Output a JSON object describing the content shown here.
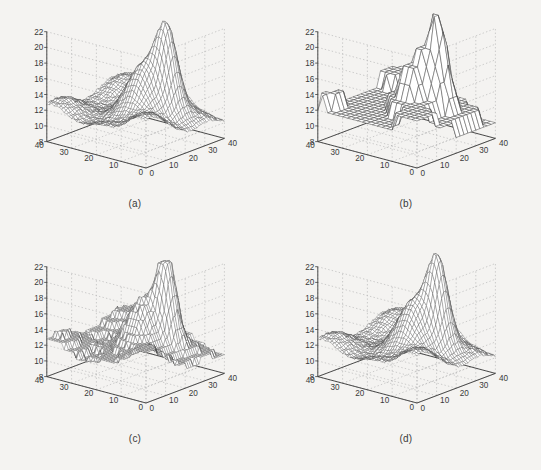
{
  "figure": {
    "background_color": "#f4f3f1",
    "ink_color": "#3a3a3a",
    "grid_color": "#b9b9b9",
    "mesh_color": "#4a4a4a",
    "panel_count": 4
  },
  "panels": [
    {
      "id": "a",
      "caption": "(a)",
      "description": "original smooth surface, fine mesh, single tall sharp peak"
    },
    {
      "id": "b",
      "caption": "(b)",
      "description": "coarsely quantized surface with terraced step plateaus"
    },
    {
      "id": "c",
      "caption": "(c)",
      "description": "quantized surface with flat-topped clipped peak"
    },
    {
      "id": "d",
      "caption": "(d)",
      "description": "reconstructed smooth surface closely matching the original"
    }
  ],
  "axes": {
    "z": {
      "ticks": [
        "8",
        "10",
        "12",
        "14",
        "16",
        "18",
        "20",
        "22"
      ],
      "min": 8,
      "max": 22,
      "step": 2
    },
    "x_right": {
      "ticks": [
        "0",
        "10",
        "20",
        "30",
        "40"
      ],
      "min": 0,
      "max": 40,
      "step": 10
    },
    "y_left": {
      "ticks": [
        "40",
        "30",
        "20",
        "10",
        "0"
      ],
      "min": 0,
      "max": 40,
      "step": 10
    }
  },
  "chart_data": {
    "type": "surface",
    "title": "",
    "xlabel": "",
    "ylabel": "",
    "zlabel": "",
    "xlim": [
      0,
      40
    ],
    "ylim": [
      0,
      40
    ],
    "zlim": [
      8,
      22
    ],
    "grid": true,
    "legend": null,
    "projection": "3d-mesh",
    "view": {
      "azimuth": -37.5,
      "elevation": 30
    },
    "xticks": [
      0,
      10,
      20,
      30,
      40
    ],
    "yticks": [
      0,
      10,
      20,
      30,
      40
    ],
    "zticks": [
      8,
      10,
      12,
      14,
      16,
      18,
      20,
      22
    ],
    "grid_size": [
      40,
      40
    ],
    "subplots": [
      {
        "id": "a",
        "label": "(a)",
        "quantized": false,
        "mesh_step": 1,
        "peak": {
          "x": 26,
          "y": 12,
          "z": 22.0,
          "width": 5.0
        },
        "secondary_peak": {
          "x": 18,
          "y": 16,
          "z": 15.2,
          "width": 6.0
        },
        "base_level": 12.0,
        "ridge_level": 13.6,
        "valley_level": 9.4,
        "z_values_summary": {
          "min": 8.8,
          "max": 22.0,
          "mean": 12.3
        }
      },
      {
        "id": "b",
        "label": "(b)",
        "quantized": true,
        "quantization_step": 2.0,
        "mesh_step": 2,
        "peak": {
          "x": 26,
          "y": 12,
          "z": 22.8,
          "width": 5.0
        },
        "secondary_peak": {
          "x": 18,
          "y": 16,
          "z": 15.4,
          "width": 6.0
        },
        "base_level": 12.0,
        "ridge_level": 13.8,
        "valley_level": 9.2,
        "z_values_summary": {
          "min": 8.0,
          "max": 22.8,
          "mean": 12.4
        }
      },
      {
        "id": "c",
        "label": "(c)",
        "quantized": true,
        "quantization_step": 0.8,
        "clipped_peak": true,
        "mesh_step": 1,
        "peak": {
          "x": 26,
          "y": 12,
          "z": 22.6,
          "width": 4.4
        },
        "secondary_peak": {
          "x": 18,
          "y": 16,
          "z": 15.3,
          "width": 6.0
        },
        "base_level": 12.0,
        "ridge_level": 13.7,
        "valley_level": 9.3,
        "z_values_summary": {
          "min": 8.4,
          "max": 22.6,
          "mean": 12.3
        }
      },
      {
        "id": "d",
        "label": "(d)",
        "quantized": false,
        "mesh_step": 1,
        "peak": {
          "x": 26,
          "y": 12,
          "z": 22.4,
          "width": 4.8
        },
        "secondary_peak": {
          "x": 18,
          "y": 16,
          "z": 15.2,
          "width": 6.0
        },
        "base_level": 12.0,
        "ridge_level": 13.6,
        "valley_level": 9.4,
        "z_values_summary": {
          "min": 8.6,
          "max": 22.4,
          "mean": 12.3
        }
      }
    ]
  }
}
